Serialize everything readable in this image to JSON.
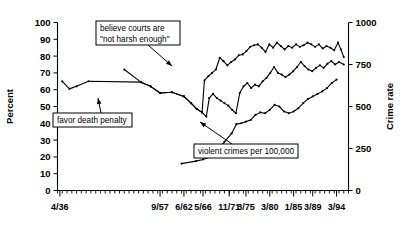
{
  "chart_data": {
    "type": "line",
    "title": "",
    "xlabel": "",
    "ylabel": "Percent",
    "y2label": "Crime rate",
    "ylim": [
      0,
      100
    ],
    "y2lim": [
      0,
      1000
    ],
    "yticks": [
      0,
      10,
      20,
      30,
      40,
      50,
      60,
      70,
      80,
      90,
      100
    ],
    "y2ticks": [
      0,
      250,
      500,
      750,
      1000
    ],
    "grid": false,
    "legend_position": "annotations-inline",
    "xtick_labels": [
      "4/36",
      "9/57",
      "6/62",
      "5/66",
      "11/71",
      "3/75",
      "3/80",
      "1/85",
      "3/89",
      "3/94"
    ],
    "xtick_positions": [
      0.5,
      21.5,
      26.5,
      30.5,
      36.0,
      39.5,
      44.5,
      49.5,
      53.5,
      58.5
    ],
    "x_range": [
      0,
      61
    ],
    "series": [
      {
        "name": "believe courts are \"not harsh enough\"",
        "axis": "left",
        "units": "percent",
        "points": [
          [
            14.0,
            72.0
          ],
          [
            17.5,
            64.5
          ],
          [
            19.5,
            62.0
          ],
          [
            21.5,
            58.0
          ],
          [
            24.0,
            58.5
          ],
          [
            26.5,
            56.0
          ],
          [
            28.0,
            52.0
          ],
          [
            29.2,
            48.5
          ],
          [
            30.3,
            46.5
          ],
          [
            30.8,
            65.5
          ],
          [
            31.6,
            68.0
          ],
          [
            32.4,
            70.0
          ],
          [
            33.2,
            72.0
          ],
          [
            34.0,
            79.0
          ],
          [
            34.8,
            77.0
          ],
          [
            35.6,
            74.5
          ],
          [
            36.4,
            76.5
          ],
          [
            37.2,
            78.0
          ],
          [
            38.0,
            80.5
          ],
          [
            38.8,
            81.0
          ],
          [
            39.6,
            83.0
          ],
          [
            40.4,
            85.5
          ],
          [
            41.2,
            86.5
          ],
          [
            42.0,
            87.0
          ],
          [
            42.8,
            85.0
          ],
          [
            43.6,
            82.5
          ],
          [
            44.4,
            87.0
          ],
          [
            45.2,
            85.0
          ],
          [
            46.0,
            88.0
          ],
          [
            46.8,
            86.0
          ],
          [
            47.6,
            84.0
          ],
          [
            48.4,
            86.0
          ],
          [
            49.2,
            85.0
          ],
          [
            50.0,
            87.0
          ],
          [
            50.8,
            85.5
          ],
          [
            51.6,
            86.5
          ],
          [
            52.4,
            88.0
          ],
          [
            53.2,
            87.0
          ],
          [
            54.0,
            85.5
          ],
          [
            54.8,
            87.0
          ],
          [
            55.6,
            84.5
          ],
          [
            56.4,
            86.0
          ],
          [
            57.2,
            85.0
          ],
          [
            58.0,
            83.5
          ],
          [
            58.8,
            88.0
          ],
          [
            59.4,
            84.0
          ],
          [
            60.0,
            79.5
          ]
        ]
      },
      {
        "name": "favor death penalty",
        "axis": "left",
        "units": "percent",
        "points": [
          [
            1.0,
            65.0
          ],
          [
            2.5,
            60.5
          ],
          [
            4.0,
            62.0
          ],
          [
            6.5,
            65.0
          ],
          [
            17.5,
            64.5
          ],
          [
            19.5,
            62.0
          ],
          [
            21.5,
            58.0
          ],
          [
            24.0,
            58.5
          ],
          [
            26.5,
            56.0
          ],
          [
            28.0,
            52.0
          ],
          [
            29.2,
            48.5
          ],
          [
            30.3,
            46.5
          ],
          [
            31.2,
            44.0
          ],
          [
            31.8,
            55.0
          ],
          [
            32.6,
            57.5
          ],
          [
            33.4,
            55.0
          ],
          [
            34.2,
            53.5
          ],
          [
            35.0,
            52.0
          ],
          [
            35.8,
            50.5
          ],
          [
            36.6,
            48.0
          ],
          [
            37.4,
            46.0
          ],
          [
            38.2,
            58.0
          ],
          [
            39.0,
            62.0
          ],
          [
            39.8,
            64.0
          ],
          [
            40.6,
            61.0
          ],
          [
            41.4,
            63.0
          ],
          [
            42.2,
            62.0
          ],
          [
            43.0,
            65.0
          ],
          [
            43.8,
            67.0
          ],
          [
            44.6,
            70.0
          ],
          [
            45.4,
            73.5
          ],
          [
            46.2,
            70.0
          ],
          [
            47.0,
            69.0
          ],
          [
            47.8,
            67.5
          ],
          [
            48.6,
            69.0
          ],
          [
            49.4,
            71.0
          ],
          [
            50.2,
            73.5
          ],
          [
            51.0,
            76.5
          ],
          [
            51.8,
            74.0
          ],
          [
            52.6,
            72.0
          ],
          [
            53.4,
            71.0
          ],
          [
            54.2,
            73.0
          ],
          [
            55.0,
            74.5
          ],
          [
            55.8,
            73.0
          ],
          [
            56.6,
            75.5
          ],
          [
            57.4,
            77.0
          ],
          [
            58.2,
            75.0
          ],
          [
            59.0,
            76.5
          ],
          [
            60.0,
            75.0
          ]
        ]
      },
      {
        "name": "violent crimes per 100,000",
        "axis": "right",
        "units": "crimes per 100,000",
        "points": [
          [
            26.0,
            160.0
          ],
          [
            29.0,
            175.0
          ],
          [
            30.5,
            185.0
          ],
          [
            32.0,
            200.0
          ],
          [
            33.5,
            240.0
          ],
          [
            35.0,
            290.0
          ],
          [
            36.5,
            340.0
          ],
          [
            37.5,
            395.0
          ],
          [
            38.5,
            400.0
          ],
          [
            39.5,
            410.0
          ],
          [
            40.5,
            420.0
          ],
          [
            41.5,
            450.0
          ],
          [
            42.5,
            465.0
          ],
          [
            43.5,
            460.0
          ],
          [
            44.5,
            480.0
          ],
          [
            45.5,
            510.0
          ],
          [
            46.5,
            500.0
          ],
          [
            47.5,
            470.0
          ],
          [
            48.5,
            460.0
          ],
          [
            49.5,
            470.0
          ],
          [
            50.5,
            490.0
          ],
          [
            51.5,
            520.0
          ],
          [
            52.5,
            545.0
          ],
          [
            53.5,
            560.0
          ],
          [
            54.5,
            575.0
          ],
          [
            55.5,
            590.0
          ],
          [
            56.5,
            610.0
          ],
          [
            57.5,
            640.0
          ],
          [
            58.5,
            660.0
          ]
        ]
      }
    ],
    "annotations": [
      {
        "id": "courts-annotation",
        "lines": [
          "believe courts are",
          "\"not harsh enough\""
        ],
        "box": {
          "x": 96,
          "y": 21,
          "w": 84,
          "h": 24
        },
        "leader": [
          [
            148,
            45
          ],
          [
            172,
            66
          ]
        ]
      },
      {
        "id": "death-penalty-annotation",
        "lines": [
          "favor death penalty"
        ],
        "box": {
          "x": 53,
          "y": 113,
          "w": 79,
          "h": 14
        },
        "leader": [
          [
            101,
            113
          ],
          [
            98,
            98
          ]
        ]
      },
      {
        "id": "violent-crimes-annotation",
        "lines": [
          "violent crimes per 100,000"
        ],
        "box": {
          "x": 194,
          "y": 144,
          "w": 104,
          "h": 14
        },
        "leader": [
          [
            232,
            144
          ],
          [
            200,
            122
          ]
        ]
      }
    ]
  }
}
